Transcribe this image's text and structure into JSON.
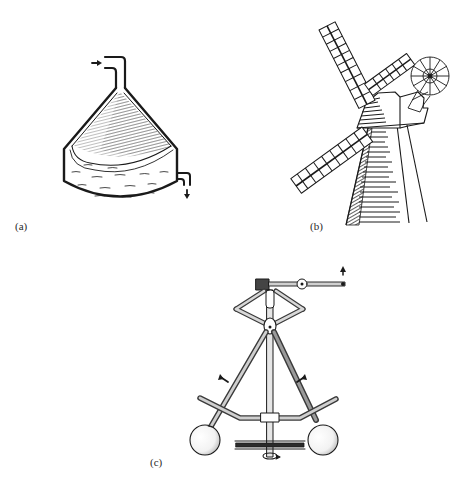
{
  "figure": {
    "panels": [
      {
        "id": "a",
        "label": "(a)",
        "subject": "conical vessel with inlet pipe and outlet pipe",
        "icons": [
          "inlet-arrow-icon",
          "outlet-arrow-icon"
        ]
      },
      {
        "id": "b",
        "label": "(b)",
        "subject": "tower windmill with sails and fantail",
        "icons": [
          "fantail-icon"
        ]
      },
      {
        "id": "c",
        "label": "(c)",
        "subject": "flyball governor with rotating weights and lever",
        "icons": [
          "lever-up-arrow-icon",
          "outward-arrow-left-icon",
          "outward-arrow-right-icon",
          "rotation-arrow-icon"
        ]
      }
    ]
  },
  "colors": {
    "ink": "#1a1a1a",
    "background": "#ffffff",
    "label": "#2a2a2a"
  }
}
